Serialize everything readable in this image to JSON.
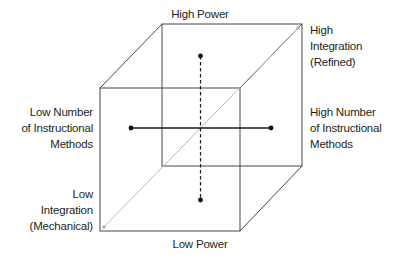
{
  "diagram": {
    "type": "3d-cube-axes",
    "colors": {
      "edge": "#333333",
      "diagonal": "#b8b8b8",
      "axis": "#1a1a1a"
    },
    "axes": {
      "vertical": {
        "style": "dashed",
        "top_label": "High Power",
        "bottom_label": "Low Power"
      },
      "horizontal": {
        "style": "solid",
        "left_label_lines": [
          "Low Number",
          "of Instructional",
          "Methods"
        ],
        "right_label_lines": [
          "High Number",
          "of Instructional",
          "Methods"
        ]
      },
      "depth": {
        "style": "gray-diagonal",
        "far_label_lines": [
          "High",
          "Integration",
          "(Refined)"
        ],
        "near_label_lines": [
          "Low",
          "Integration",
          "(Mechanical)"
        ]
      }
    }
  }
}
